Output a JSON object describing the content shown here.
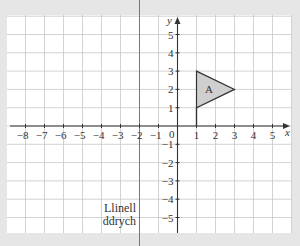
{
  "figure": {
    "background": "#e6e6e6",
    "grid_background": "#ffffff",
    "grid_line_color": "#c8c8c8",
    "axis_color": "#333333",
    "shape_fill": "#cfcfcf",
    "shape_stroke": "#333333"
  },
  "axes": {
    "x_label": "x",
    "y_label": "y",
    "origin_label": "0",
    "x_ticks": [
      "-8",
      "-7",
      "-6",
      "-5",
      "-4",
      "-3",
      "-2",
      "-1",
      "1",
      "2",
      "3",
      "4",
      "5"
    ],
    "y_ticks": [
      "5",
      "4",
      "3",
      "2",
      "1",
      "-1",
      "-2",
      "-3",
      "-4",
      "-5"
    ]
  },
  "shape": {
    "label": "A",
    "vertices": [
      [
        1,
        3
      ],
      [
        3,
        2
      ],
      [
        1,
        1
      ]
    ]
  },
  "mirror_line": {
    "x": -2,
    "label_line1": "Llinell",
    "label_line2": "ddrych"
  },
  "chart_data": {
    "type": "scatter",
    "title": "",
    "xlabel": "x",
    "ylabel": "y",
    "xlim": [
      -9,
      6
    ],
    "ylim": [
      -6,
      6
    ],
    "grid": true,
    "x_ticks": [
      -8,
      -7,
      -6,
      -5,
      -4,
      -3,
      -2,
      -1,
      1,
      2,
      3,
      4,
      5
    ],
    "y_ticks": [
      -5,
      -4,
      -3,
      -2,
      -1,
      1,
      2,
      3,
      4,
      5
    ],
    "series": [
      {
        "name": "Triangle A",
        "points": [
          [
            1,
            3
          ],
          [
            3,
            2
          ],
          [
            1,
            1
          ]
        ],
        "closed": true,
        "fill": "#cfcfcf"
      },
      {
        "name": "Mirror line (Llinell ddrych)",
        "type": "vertical_line",
        "x": -2
      }
    ],
    "annotations": [
      "A",
      "Llinell ddrych"
    ]
  }
}
